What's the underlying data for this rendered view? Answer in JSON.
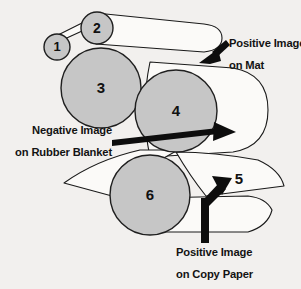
{
  "diagram": {
    "background_color": "#f2f0ee",
    "roller_fill_color": "#c6c6c6",
    "roller_stroke_color": "#1f1f1f",
    "sheet_fill_color": "#fbfaf8",
    "arrow_color": "#0d0d0d",
    "rollers": [
      {
        "id": "roller-1",
        "label": "1",
        "cx": 57,
        "cy": 47,
        "r": 13
      },
      {
        "id": "roller-2",
        "label": "2",
        "cx": 97,
        "cy": 28,
        "r": 16
      },
      {
        "id": "roller-3",
        "label": "3",
        "cx": 101,
        "cy": 88,
        "r": 40
      },
      {
        "id": "roller-4",
        "label": "4",
        "cx": 176,
        "cy": 111,
        "r": 41
      },
      {
        "id": "roller-5",
        "label": "5",
        "cx": 236,
        "cy": 180,
        "r": 0
      },
      {
        "id": "roller-6",
        "label": "6",
        "cx": 150,
        "cy": 195,
        "r": 40
      }
    ],
    "labels": [
      {
        "id": "label-positive-mat",
        "line1": "Positive Image",
        "line2": "on Mat",
        "x": 228,
        "y1": 45,
        "y2": 67,
        "align": "start"
      },
      {
        "id": "label-negative-blanket",
        "line1": "Negative Image",
        "line2": "on Rubber Blanket",
        "x": 110,
        "y1": 132,
        "y2": 155,
        "align": "end"
      },
      {
        "id": "label-positive-copy-paper",
        "line1": "Positive Image",
        "line2": "on Copy Paper",
        "x": 230,
        "y1": 253,
        "y2": 275,
        "align": "middle"
      }
    ],
    "arrows": [
      {
        "id": "arrow-to-mat",
        "direction": "down-left",
        "from_x": 226,
        "from_y": 42,
        "to_x": 201,
        "to_y": 62
      },
      {
        "id": "arrow-blanket-transfer",
        "direction": "right",
        "from_x": 112,
        "from_y": 136,
        "to_x": 233,
        "to_y": 132
      },
      {
        "id": "arrow-copy-paper-feed",
        "direction": "up-right",
        "from_x": 205,
        "from_y": 243,
        "to_x": 225,
        "to_y": 186
      }
    ],
    "roller_number_labels": {
      "one": "1",
      "two": "2",
      "three": "3",
      "four": "4",
      "five": "5",
      "six": "6"
    }
  }
}
